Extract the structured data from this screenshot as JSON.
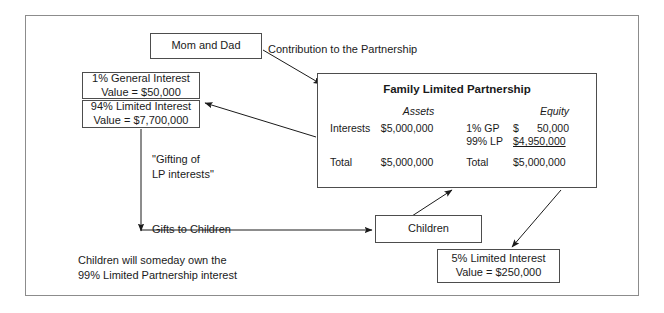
{
  "diagram": {
    "boxes": {
      "mom_and_dad": "Mom and Dad",
      "general_interest_line1": "1% General Interest",
      "general_interest_line2": "Value = $50,000",
      "limited94_line1": "94% Limited Interest",
      "limited94_line2": "Value = $7,700,000",
      "children": "Children",
      "limited5_line1": "5% Limited Interest",
      "limited5_line2": "Value = $250,000"
    },
    "partnership": {
      "title": "Family Limited Partnership",
      "assets_header": "Assets",
      "equity_header": "Equity",
      "assets_row1_label": "Interests",
      "assets_row1_value": "$5,000,000",
      "assets_total_label": "Total",
      "assets_total_value": "$5,000,000",
      "equity_row1_label": "1% GP",
      "equity_row1_currency": "$",
      "equity_row1_value": "50,000",
      "equity_row2_label": "99% LP",
      "equity_row2_value": "$4,950,000",
      "equity_total_label": "Total",
      "equity_total_value": "$5,000,000"
    },
    "labels": {
      "contribution": "Contribution to the Partnership",
      "gifting": "\"Gifting of\nLP interests\"",
      "gifts_to_children": "Gifts to Children",
      "footnote": "Children will someday own the\n99% Limited Partnership interest"
    },
    "colors": {
      "border": "#4d4d4d",
      "frame": "#8c8c8c",
      "text": "#1a1a1a",
      "background": "#ffffff"
    }
  }
}
